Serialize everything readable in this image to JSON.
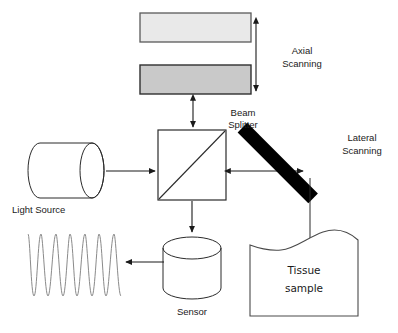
{
  "diagram": {
    "background_color": "#ffffff",
    "labels": {
      "axial_scanning_line1": "Axial",
      "axial_scanning_line2": "Scanning",
      "beam_splitter_line1": "Beam",
      "beam_splitter_line2": "Splitter",
      "lateral_scanning_line1": "Lateral",
      "lateral_scanning_line2": "Scanning",
      "light_source": "Light Source",
      "sensor": "Sensor",
      "tissue_line1": "Tissue",
      "tissue_line2": "sample"
    },
    "components": [
      {
        "name": "reference-mirror-upper",
        "shape": "rectangle",
        "fill": "#e8e8e8",
        "stroke": "#555555",
        "x": 140,
        "y": 13,
        "width": 111,
        "height": 29
      },
      {
        "name": "reference-mirror-lower",
        "shape": "rectangle",
        "fill": "#c9c9c9",
        "stroke": "#333333",
        "x": 140,
        "y": 65,
        "width": 111,
        "height": 29
      },
      {
        "name": "beam-splitter",
        "shape": "square-with-diagonal",
        "fill": "#ffffff",
        "stroke": "#2b2b2b",
        "x": 158,
        "y": 130,
        "width": 68,
        "height": 70
      },
      {
        "name": "light-source",
        "shape": "cylinder-horizontal",
        "fill": "#ffffff",
        "stroke": "#2b2b2b",
        "x": 17,
        "y": 143,
        "width": 90,
        "height": 55
      },
      {
        "name": "sensor",
        "shape": "cylinder-vertical",
        "fill": "#ffffff",
        "stroke": "#2b2b2b",
        "x": 163,
        "y": 236,
        "width": 58,
        "height": 64
      },
      {
        "name": "lateral-scanning-mirror",
        "shape": "rotated-bar",
        "fill": "#000000",
        "angle_deg": 45,
        "x": 277,
        "y": 120,
        "length": 100,
        "thickness": 15
      },
      {
        "name": "tissue-sample",
        "shape": "wavy-top-block",
        "fill": "#ffffff",
        "stroke": "#4a4a4a",
        "x": 250,
        "y": 228,
        "width": 110,
        "height": 88
      },
      {
        "name": "interference-waveform",
        "shape": "sine-wave",
        "stroke": "#8a8a8a",
        "cycles": 4,
        "x": 28,
        "y": 232,
        "width": 93,
        "height": 68
      }
    ],
    "arrows": [
      {
        "name": "axial-scan-arrow",
        "type": "double",
        "orientation": "vertical",
        "x1": 256,
        "y1": 22,
        "x2": 256,
        "y2": 92
      },
      {
        "name": "reference-beam-arrow",
        "type": "double",
        "orientation": "vertical",
        "x1": 193,
        "y1": 99,
        "x2": 193,
        "y2": 128
      },
      {
        "name": "source-beam-arrow",
        "type": "single",
        "orientation": "horizontal",
        "x1": 110,
        "y1": 171,
        "x2": 156,
        "y2": 171
      },
      {
        "name": "sample-beam-arrow",
        "type": "double",
        "orientation": "horizontal",
        "x1": 229,
        "y1": 171,
        "x2": 304,
        "y2": 171
      },
      {
        "name": "detection-beam-arrow",
        "type": "single",
        "orientation": "vertical",
        "x1": 192,
        "y1": 202,
        "x2": 192,
        "y2": 233
      },
      {
        "name": "signal-output-arrow",
        "type": "single",
        "orientation": "horizontal",
        "x1": 163,
        "y1": 262,
        "x2": 125,
        "y2": 262
      },
      {
        "name": "mirror-to-tissue-line",
        "type": "plain",
        "orientation": "vertical",
        "x1": 310,
        "y1": 180,
        "x2": 310,
        "y2": 240
      }
    ]
  }
}
